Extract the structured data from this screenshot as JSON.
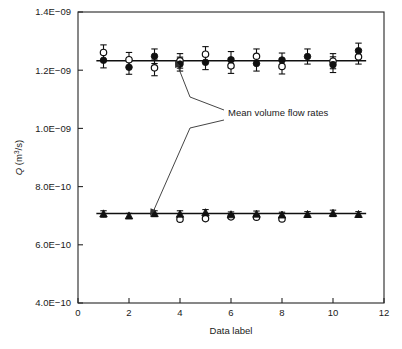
{
  "chart_data": {
    "type": "scatter",
    "title": "",
    "xlabel": "Data label",
    "ylabel": "Q (m3/s)",
    "ylabel_base": "Q (m",
    "ylabel_sup": "3",
    "ylabel_tail": "/s)",
    "xlim": [
      0,
      12
    ],
    "ylim": [
      4e-10,
      1.4e-09
    ],
    "xticks": [
      0,
      2,
      4,
      6,
      8,
      10,
      12
    ],
    "xtick_labels": [
      "0",
      "2",
      "4",
      "6",
      "8",
      "10",
      "12"
    ],
    "yticks": [
      4e-10,
      6e-10,
      8e-10,
      1e-09,
      1.2e-09,
      1.4e-09
    ],
    "ytick_labels": [
      "4.0E−10",
      "6.0E−10",
      "8.0E−10",
      "1.0E−09",
      "1.2E−09",
      "1.4E−09"
    ],
    "grid": false,
    "legend": "none",
    "x": [
      1,
      2,
      3,
      4,
      5,
      6,
      7,
      8,
      9,
      10,
      11
    ],
    "series": [
      {
        "name": "upper-filled-circles",
        "marker": "filled-circle",
        "values": [
          1.234e-09,
          1.21e-09,
          1.248e-09,
          1.221e-09,
          1.227e-09,
          1.236e-09,
          1.223e-09,
          1.235e-09,
          1.247e-09,
          1.219e-09,
          1.267e-09
        ],
        "errors": [
          2.6e-11,
          2.4e-11,
          2.5e-11,
          2.4e-11,
          2.5e-11,
          2.8e-11,
          2.6e-11,
          2.4e-11,
          2.6e-11,
          2.7e-11,
          2.6e-11
        ]
      },
      {
        "name": "upper-open-circles",
        "marker": "open-circle",
        "values": [
          1.261e-09,
          1.236e-09,
          1.208e-09,
          1.232e-09,
          1.255e-09,
          1.215e-09,
          1.248e-09,
          1.213e-09,
          null,
          1.231e-09,
          1.246e-09
        ],
        "errors": [
          2.6e-11,
          2.5e-11,
          2.7e-11,
          2.5e-11,
          2.6e-11,
          2.6e-11,
          2.5e-11,
          2.6e-11,
          null,
          2.6e-11,
          2.5e-11
        ]
      },
      {
        "name": "lower-filled-triangles",
        "marker": "filled-triangle",
        "values": [
          7.06e-10,
          6.99e-10,
          7.07e-10,
          7.05e-10,
          7.1e-10,
          7.03e-10,
          7.05e-10,
          7.02e-10,
          7.04e-10,
          7.08e-10,
          7.04e-10
        ],
        "errors": [
          1.1e-11,
          9e-12,
          1e-11,
          1.2e-11,
          1.1e-11,
          1e-11,
          1.1e-11,
          1e-11,
          1e-11,
          1.1e-11,
          1e-11
        ]
      },
      {
        "name": "lower-open-markers",
        "marker": "open-circle",
        "values": [
          null,
          null,
          null,
          6.88e-10,
          6.9e-10,
          6.96e-10,
          6.95e-10,
          6.89e-10,
          null,
          null,
          null
        ],
        "errors": [
          null,
          null,
          null,
          0,
          0,
          0,
          0,
          0,
          null,
          null,
          null
        ]
      }
    ],
    "mean_lines": [
      {
        "name": "upper-mean",
        "value": 1.2325e-09,
        "x_from": 0.72,
        "x_to": 11.3
      },
      {
        "name": "lower-mean",
        "value": 7.075e-10,
        "x_from": 0.72,
        "x_to": 11.3
      }
    ],
    "annotations": [
      {
        "name": "mean-volume-flow-rates",
        "text": "Mean volume flow rates",
        "text_x": 228,
        "text_y": 116,
        "arrows": [
          {
            "name": "arrow-to-upper",
            "path": "M 224,110 L 190,97 L 177,64",
            "tip": [
              175,
              60
            ],
            "angle": -111
          },
          {
            "name": "arrow-to-lower",
            "path": "M 224,120 L 190,128 L 153,212",
            "tip": [
              150,
              216
            ],
            "angle": 114
          }
        ]
      }
    ]
  },
  "plot_geometry": {
    "left": 78,
    "right": 384,
    "top": 12,
    "bottom": 303
  }
}
